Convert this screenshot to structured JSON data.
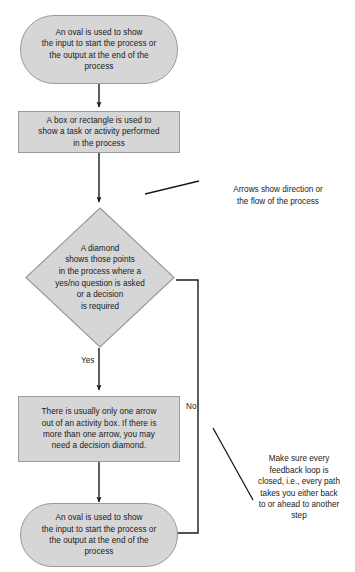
{
  "diagram": {
    "type": "flowchart",
    "colors": {
      "shape_fill": "#d6d6d6",
      "shape_stroke": "#9a9a9a",
      "connector": "#1a1a1a",
      "text": "#1a1a1a",
      "background": "#ffffff"
    },
    "nodes": {
      "start_oval": {
        "shape": "oval",
        "text": "An oval is used to show\nthe input to start the process or\nthe output at the end of the\nprocess"
      },
      "process_rect": {
        "shape": "rectangle",
        "text": "A box or rectangle is used to\nshow a task or activity performed\nin the process"
      },
      "decision_diamond": {
        "shape": "diamond",
        "text": "A diamond\nshows those points\nin the process where a\nyes/no question is asked\nor a decision\nis required"
      },
      "activity_rect": {
        "shape": "rectangle",
        "text": "There is usually only one arrow\nout of an activity box. If there is\nmore than one arrow, you may\nneed a decision diamond."
      },
      "end_oval": {
        "shape": "oval",
        "text": "An oval is used to show\nthe input to start the process or\nthe output at the end of the\nprocess"
      }
    },
    "edge_labels": {
      "yes": "Yes",
      "no": "No"
    },
    "annotations": {
      "arrows_note": "Arrows show direction or\nthe flow of the process",
      "feedback_note": "Make sure every\nfeedback loop is\nclosed, i.e., every path\ntakes you either back\nto or ahead to another\nstep"
    }
  }
}
